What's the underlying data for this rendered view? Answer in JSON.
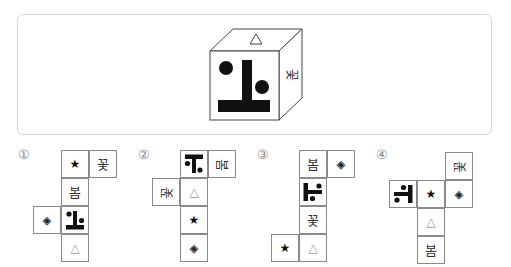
{
  "question": {
    "cube": {
      "top_face": "△",
      "front_face": "figure",
      "right_face": "꽃"
    }
  },
  "options": [
    {
      "label": "①",
      "cells": [
        {
          "symbol": "★",
          "type": "star"
        },
        {
          "symbol": "꽃",
          "type": "hangul"
        },
        {
          "symbol": "봄",
          "type": "hangul"
        },
        {
          "symbol": "◈",
          "type": "diamond"
        },
        {
          "symbol": "figure",
          "type": "figure",
          "rotation": 0
        },
        {
          "symbol": "△",
          "type": "triangle"
        }
      ]
    },
    {
      "label": "②",
      "cells": [
        {
          "symbol": "figure",
          "type": "figure",
          "rotation": 180
        },
        {
          "symbol": "봄",
          "type": "hangul"
        },
        {
          "symbol": "꽃",
          "type": "hangul"
        },
        {
          "symbol": "△",
          "type": "triangle"
        },
        {
          "symbol": "★",
          "type": "star"
        },
        {
          "symbol": "◈",
          "type": "diamond"
        }
      ]
    },
    {
      "label": "③",
      "cells": [
        {
          "symbol": "봄",
          "type": "hangul"
        },
        {
          "symbol": "◈",
          "type": "diamond"
        },
        {
          "symbol": "figure",
          "type": "figure",
          "rotation": 90
        },
        {
          "symbol": "꽃",
          "type": "hangul"
        },
        {
          "symbol": "★",
          "type": "star"
        },
        {
          "symbol": "△",
          "type": "triangle"
        }
      ]
    },
    {
      "label": "④",
      "cells": [
        {
          "symbol": "꽃",
          "type": "hangul"
        },
        {
          "symbol": "figure",
          "type": "figure",
          "rotation": -90
        },
        {
          "symbol": "★",
          "type": "star"
        },
        {
          "symbol": "◈",
          "type": "diamond"
        },
        {
          "symbol": "△",
          "type": "triangle"
        },
        {
          "symbol": "봄",
          "type": "hangul"
        }
      ]
    }
  ]
}
